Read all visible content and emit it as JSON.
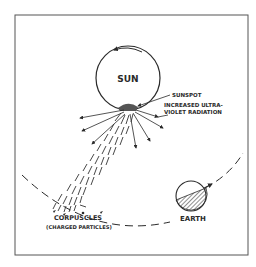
{
  "diagram": {
    "labels": {
      "sun": "SUN",
      "sunspot": "SUNSPOT",
      "uv_line1": "INCREASED ULTRA-",
      "uv_line2": "VIOLET RADIATION",
      "corpuscles": "CORPUSCLES",
      "charged": "(CHARGED PARTICLES)",
      "earth": "EARTH"
    },
    "colors": {
      "ink": "#2a2a2a",
      "background": "#ffffff",
      "frame": "#555555"
    }
  }
}
